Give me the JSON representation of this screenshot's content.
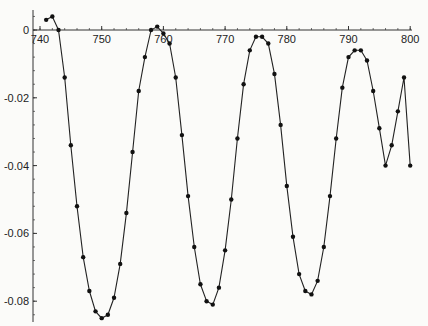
{
  "chart_data": {
    "type": "line",
    "title": "",
    "xlabel": "",
    "ylabel": "",
    "xlim": [
      739,
      801
    ],
    "ylim": [
      -0.087,
      0.005
    ],
    "grid": false,
    "legend": null,
    "x_ticks": [
      740,
      750,
      760,
      770,
      780,
      790,
      800
    ],
    "x_tick_labels": [
      "740",
      "750",
      "760",
      "770",
      "780",
      "790",
      "800"
    ],
    "y_ticks": [
      0,
      -0.02,
      -0.04,
      -0.06,
      -0.08
    ],
    "y_tick_labels": [
      "0",
      "-0.02",
      "-0.04",
      "-0.06",
      "-0.08"
    ],
    "series": [
      {
        "name": "series-1",
        "marker": "dot",
        "x": [
          741,
          742,
          743,
          744,
          745,
          746,
          747,
          748,
          749,
          750,
          751,
          752,
          753,
          754,
          755,
          756,
          757,
          758,
          759,
          760,
          761,
          762,
          763,
          764,
          765,
          766,
          767,
          768,
          769,
          770,
          771,
          772,
          773,
          774,
          775,
          776,
          777,
          778,
          779,
          780,
          781,
          782,
          783,
          784,
          785,
          786,
          787,
          788,
          789,
          790,
          791,
          792,
          793,
          794,
          795,
          796,
          797,
          798,
          799,
          800
        ],
        "y": [
          0.003,
          0.004,
          0.0,
          -0.014,
          -0.034,
          -0.052,
          -0.067,
          -0.077,
          -0.083,
          -0.085,
          -0.084,
          -0.079,
          -0.069,
          -0.054,
          -0.036,
          -0.018,
          -0.008,
          0.0,
          0.001,
          -0.001,
          -0.004,
          -0.014,
          -0.031,
          -0.049,
          -0.064,
          -0.075,
          -0.08,
          -0.081,
          -0.076,
          -0.065,
          -0.05,
          -0.032,
          -0.016,
          -0.006,
          -0.002,
          -0.002,
          -0.004,
          -0.013,
          -0.028,
          -0.046,
          -0.061,
          -0.072,
          -0.077,
          -0.078,
          -0.074,
          -0.064,
          -0.049,
          -0.032,
          -0.017,
          -0.008,
          -0.006,
          -0.006,
          -0.009,
          -0.018,
          -0.029,
          -0.04,
          -0.034,
          -0.024,
          -0.014,
          -0.04
        ]
      }
    ]
  }
}
